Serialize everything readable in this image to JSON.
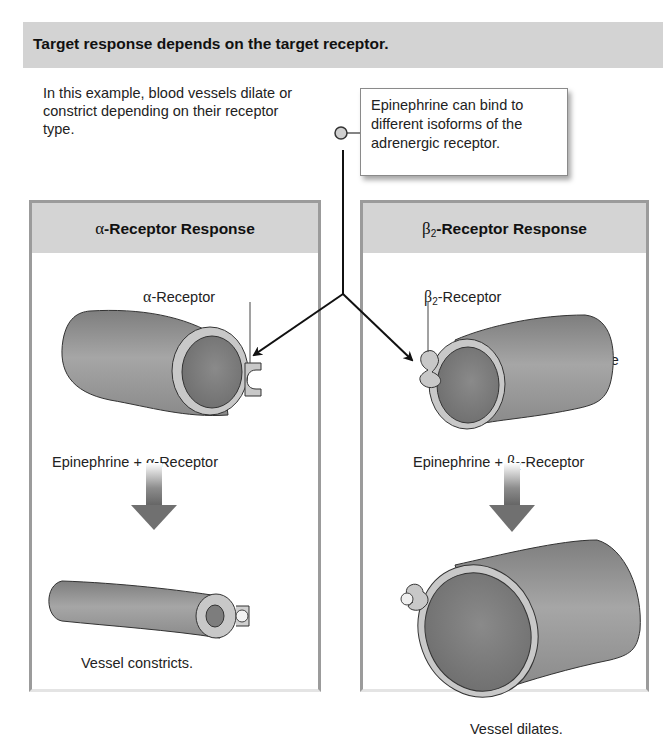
{
  "title": "Target response depends on the target receptor.",
  "intro_text": "In this example, blood vessels dilate or constrict depending on their receptor type.",
  "callout_text": "Epinephrine can bind to different isoforms of the adrenergic receptor.",
  "panels": {
    "alpha": {
      "header_greek": "α",
      "header_text": "-Receptor Response",
      "receptor_greek": "α",
      "receptor_label": "-Receptor",
      "vessel_label_line1": "Intestinal",
      "vessel_label_line2": "blood vessel",
      "binding_prefix": "Epinephrine + ",
      "binding_greek": "α",
      "binding_suffix": "-Receptor",
      "result": "Vessel constricts."
    },
    "beta2": {
      "header_greek": "β",
      "header_sub": "2",
      "header_text": "-Receptor Response",
      "receptor_greek": "β",
      "receptor_sub": "2",
      "receptor_label": "-Receptor",
      "vessel_label_line1": "Skeletal muscle",
      "vessel_label_line2": "blood vessel",
      "binding_prefix": "Epinephrine + ",
      "binding_greek": "β",
      "binding_sub": "2",
      "binding_suffix": "-Receptor",
      "result": "Vessel dilates."
    }
  },
  "colors": {
    "header_bg": "#d3d3d3",
    "panel_border": "#9b9b9b",
    "vessel_outer": "#8f8f8f",
    "vessel_wall": "#c9c9c9",
    "vessel_lumen": "#7d7d7d",
    "arrow_gray": "#6e6e6e"
  }
}
